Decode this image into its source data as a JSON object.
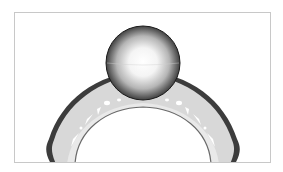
{
  "image": {
    "subject": "3D render of a ring with a spherical pearl setting",
    "background_color": "#ffffff",
    "frame_border_color": "#c8c8c8",
    "colors": {
      "band_fill": "#d9d9d9",
      "band_edge": "#4a4a4a",
      "sphere_highlight": "#ffffff",
      "sphere_shadow": "#2a2a2a"
    }
  }
}
